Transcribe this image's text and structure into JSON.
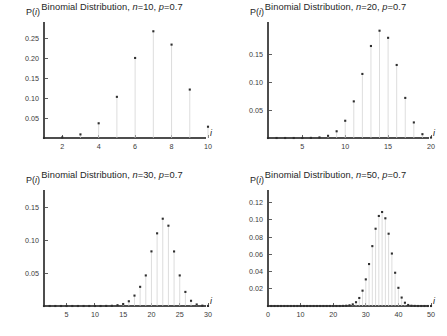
{
  "figure": {
    "background_color": "#ffffff",
    "marker_color": "#2f2f2f",
    "stem_color": "#d2d2d2",
    "axis_color": "#4d4d4d",
    "layout": "2x2 grid of stem plots",
    "shared_y_label": "P(i)",
    "shared_x_label": "i"
  },
  "chart_data": [
    {
      "type": "scatter",
      "id": "binomial-n10",
      "title": "Binomial Distribution, n=10, p=0.7",
      "title_parts": {
        "prefix": "Binomial Distribution, ",
        "n_symbol": "n",
        "n_value": "=10, ",
        "p_symbol": "p",
        "p_value": "=0.7"
      },
      "n": 10,
      "p": 0.7,
      "xlabel": "i",
      "ylabel": "P(i)",
      "grid": false,
      "legend": "none",
      "xlim": [
        1,
        10
      ],
      "ylim": [
        0,
        0.28
      ],
      "xticks": [
        2,
        4,
        6,
        8,
        10
      ],
      "xtick_labels": [
        "2",
        "4",
        "6",
        "8",
        "10"
      ],
      "yticks": [
        0.05,
        0.1,
        0.15,
        0.2,
        0.25
      ],
      "ytick_labels": [
        "0.05",
        "0.10",
        "0.15",
        "0.20",
        "0.25"
      ],
      "x": [
        1,
        2,
        3,
        4,
        5,
        6,
        7,
        8,
        9,
        10
      ],
      "values": [
        0.0001,
        0.0014,
        0.009,
        0.0368,
        0.1029,
        0.2001,
        0.2668,
        0.2335,
        0.1211,
        0.0282
      ]
    },
    {
      "type": "scatter",
      "id": "binomial-n20",
      "title": "Binomial Distribution, n=20, p=0.7",
      "title_parts": {
        "prefix": "Binomial Distribution, ",
        "n_symbol": "n",
        "n_value": "=20, ",
        "p_symbol": "p",
        "p_value": "=0.7"
      },
      "n": 20,
      "p": 0.7,
      "xlabel": "i",
      "ylabel": "P(i)",
      "grid": false,
      "legend": "none",
      "xlim": [
        1,
        20
      ],
      "ylim": [
        0,
        0.2
      ],
      "xticks": [
        5,
        10,
        15,
        20
      ],
      "xtick_labels": [
        "5",
        "10",
        "15",
        "20"
      ],
      "yticks": [
        0.05,
        0.1,
        0.15
      ],
      "ytick_labels": [
        "0.05",
        "0.10",
        "0.15"
      ],
      "x": [
        1,
        2,
        3,
        4,
        5,
        6,
        7,
        8,
        9,
        10,
        11,
        12,
        13,
        14,
        15,
        16,
        17,
        18,
        19,
        20
      ],
      "values": [
        0.0,
        0.0,
        0.0,
        0.0,
        0.0,
        0.0002,
        0.001,
        0.0039,
        0.012,
        0.0308,
        0.0654,
        0.1144,
        0.1643,
        0.1916,
        0.1789,
        0.1304,
        0.0716,
        0.0278,
        0.0068,
        0.0008
      ]
    },
    {
      "type": "scatter",
      "id": "binomial-n30",
      "title": "Binomial Distribution, n=30, p=0.7",
      "title_parts": {
        "prefix": "Binomial Distribution, ",
        "n_symbol": "n",
        "n_value": "=30, ",
        "p_symbol": "p",
        "p_value": "=0.7"
      },
      "n": 30,
      "p": 0.7,
      "xlabel": "i",
      "ylabel": "P(i)",
      "grid": false,
      "legend": "none",
      "xlim": [
        1,
        30
      ],
      "ylim": [
        0,
        0.17
      ],
      "xticks": [
        5,
        10,
        15,
        20,
        25,
        30
      ],
      "xtick_labels": [
        "5",
        "10",
        "15",
        "20",
        "25",
        "30"
      ],
      "yticks": [
        0.05,
        0.1,
        0.15
      ],
      "ytick_labels": [
        "0.05",
        "0.10",
        "0.15"
      ],
      "x": [
        1,
        2,
        3,
        4,
        5,
        6,
        7,
        8,
        9,
        10,
        11,
        12,
        13,
        14,
        15,
        16,
        17,
        18,
        19,
        20,
        21,
        22,
        23,
        24,
        25,
        26,
        27,
        28,
        29,
        30
      ],
      "values": [
        0.0,
        0.0,
        0.0,
        0.0,
        0.0,
        0.0,
        0.0,
        0.0,
        0.0,
        0.0,
        0.0,
        0.0001,
        0.0003,
        0.0012,
        0.003,
        0.0072,
        0.0158,
        0.0291,
        0.0464,
        0.0829,
        0.1103,
        0.1325,
        0.1219,
        0.0828,
        0.0464,
        0.0214,
        0.0079,
        0.0023,
        0.0005,
        0.0001
      ]
    },
    {
      "type": "scatter",
      "id": "binomial-n50",
      "title": "Binomial Distribution, n=50, p=0.7",
      "title_parts": {
        "prefix": "Binomial Distribution, ",
        "n_symbol": "n",
        "n_value": "=50, ",
        "p_symbol": "p",
        "p_value": "=0.7"
      },
      "n": 50,
      "p": 0.7,
      "xlabel": "i",
      "ylabel": "P(i)",
      "grid": false,
      "legend": "none",
      "xlim": [
        0,
        50
      ],
      "ylim": [
        0,
        0.13
      ],
      "xticks": [
        0,
        10,
        20,
        30,
        40,
        50
      ],
      "xtick_labels": [
        "0",
        "10",
        "20",
        "30",
        "40",
        "50"
      ],
      "yticks": [
        0.02,
        0.04,
        0.06,
        0.08,
        0.1,
        0.12
      ],
      "ytick_labels": [
        "0.02",
        "0.04",
        "0.06",
        "0.08",
        "0.10",
        "0.12"
      ],
      "x": [
        0,
        1,
        2,
        3,
        4,
        5,
        6,
        7,
        8,
        9,
        10,
        11,
        12,
        13,
        14,
        15,
        16,
        17,
        18,
        19,
        20,
        21,
        22,
        23,
        24,
        25,
        26,
        27,
        28,
        29,
        30,
        31,
        32,
        33,
        34,
        35,
        36,
        37,
        38,
        39,
        40,
        41,
        42,
        43,
        44,
        45,
        46,
        47,
        48,
        49,
        50
      ],
      "values": [
        0.0,
        0.0,
        0.0,
        0.0,
        0.0,
        0.0,
        0.0,
        0.0,
        0.0,
        0.0,
        0.0,
        0.0,
        0.0,
        0.0,
        0.0,
        0.0,
        0.0,
        0.0,
        0.0,
        0.0,
        0.0,
        0.0,
        0.0,
        0.0001,
        0.0003,
        0.0008,
        0.0019,
        0.0044,
        0.0093,
        0.0178,
        0.0309,
        0.0487,
        0.0695,
        0.0897,
        0.1045,
        0.1091,
        0.1018,
        0.0839,
        0.0609,
        0.0386,
        0.0211,
        0.0098,
        0.0038,
        0.0012,
        0.0003,
        0.0001,
        0.0,
        0.0,
        0.0,
        0.0,
        0.0
      ]
    }
  ]
}
